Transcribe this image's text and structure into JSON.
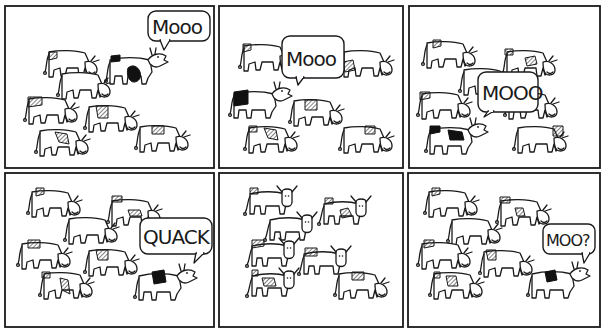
{
  "comic": {
    "panel_count": 6,
    "ink_color": "#1a1a1a",
    "background": "#ffffff",
    "panels": [
      {
        "id": 1,
        "speech": "Mooo",
        "speaker": "cow with black patches facing right, upper center"
      },
      {
        "id": 2,
        "speech": "Mooo",
        "speaker": "cow in upper center of herd"
      },
      {
        "id": 3,
        "speech": "MOOO",
        "speaker": "cow in middle of herd"
      },
      {
        "id": 4,
        "speech": "QUACK",
        "speaker": "cow with black patch at lower right"
      },
      {
        "id": 5,
        "speech": "",
        "speaker": "herd of cows looking forward, silent"
      },
      {
        "id": 6,
        "speech": "MOO?",
        "speaker": "cow with black patch at lower right"
      }
    ]
  }
}
